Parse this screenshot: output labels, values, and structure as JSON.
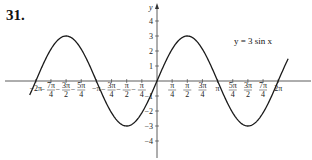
{
  "problem_number": "31.",
  "equation_label": "y = 3 sin x",
  "colors": {
    "curve": "#1a1a1a",
    "axis": "#333333",
    "text": "#222222"
  },
  "chart_data": {
    "type": "line",
    "title": "",
    "annotation": "y = 3 sin x",
    "function": "3*sin(x)",
    "amplitude": 3,
    "xlabel": "x",
    "ylabel": "y",
    "xlim": [
      -6.6,
      6.8
    ],
    "ylim": [
      -4.5,
      4.5
    ],
    "grid": false,
    "x_ticks": [
      {
        "value": -6.2832,
        "label": "-2π"
      },
      {
        "value": -5.4978,
        "label": "-7π/4"
      },
      {
        "value": -4.7124,
        "label": "-3π/2"
      },
      {
        "value": -3.927,
        "label": "-5π/4"
      },
      {
        "value": -3.1416,
        "label": "-π"
      },
      {
        "value": -2.3562,
        "label": "-3π/4"
      },
      {
        "value": -1.5708,
        "label": "-π/2"
      },
      {
        "value": -0.7854,
        "label": "-π/4"
      },
      {
        "value": 0.7854,
        "label": "π/4"
      },
      {
        "value": 1.5708,
        "label": "π/2"
      },
      {
        "value": 2.3562,
        "label": "3π/4"
      },
      {
        "value": 3.1416,
        "label": "π"
      },
      {
        "value": 3.927,
        "label": "5π/4"
      },
      {
        "value": 4.7124,
        "label": "3π/2"
      },
      {
        "value": 5.4978,
        "label": "7π/4"
      },
      {
        "value": 6.2832,
        "label": "2π"
      }
    ],
    "y_ticks": [
      {
        "value": 4,
        "label": "4"
      },
      {
        "value": 3,
        "label": "3"
      },
      {
        "value": 2,
        "label": "2"
      },
      {
        "value": 1,
        "label": "1"
      },
      {
        "value": -1,
        "label": "-1"
      },
      {
        "value": -2,
        "label": "-2"
      },
      {
        "value": -3,
        "label": "-3"
      },
      {
        "value": -4,
        "label": "-4"
      }
    ],
    "key_points": [
      {
        "x": -6.2832,
        "y": 0
      },
      {
        "x": -4.7124,
        "y": 3
      },
      {
        "x": -3.1416,
        "y": 0
      },
      {
        "x": -1.5708,
        "y": -3
      },
      {
        "x": 0,
        "y": 0
      },
      {
        "x": 1.5708,
        "y": 3
      },
      {
        "x": 3.1416,
        "y": 0
      },
      {
        "x": 4.7124,
        "y": -3
      },
      {
        "x": 6.2832,
        "y": 0
      }
    ]
  }
}
